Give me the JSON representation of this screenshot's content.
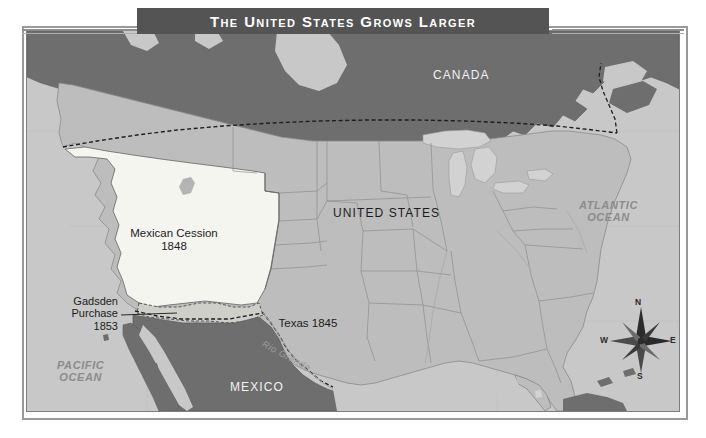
{
  "title": {
    "text": "The United States Grows Larger",
    "banner_color": "#545454",
    "text_color": "#ffffff"
  },
  "map": {
    "palette": {
      "ocean": "#c8c8c8",
      "united_states": "#bdbdbd",
      "foreign_territory": "#6e6e6e",
      "mexican_cession": "#f5f5f0",
      "lakes": "#d2d2d2",
      "border_line": "#555555",
      "state_line": "#8e8e8e"
    },
    "labels": {
      "canada": "CANADA",
      "united_states": "UNITED STATES",
      "mexico": "MEXICO",
      "atlantic_ocean": "ATLANTIC\nOCEAN",
      "pacific_ocean": "PACIFIC\nOCEAN",
      "mexican_cession": "Mexican Cession\n1848",
      "texas": "Texas 1845",
      "gadsden_purchase": "Gadsden\nPurchase\n1853",
      "rio_grande": "Rio Grande"
    },
    "territories": [
      {
        "name": "Mexican Cession",
        "year": "1848",
        "fill": "#f5f5f0"
      },
      {
        "name": "Texas",
        "year": "1845",
        "fill": "#bdbdbd"
      },
      {
        "name": "Gadsden Purchase",
        "year": "1853",
        "fill": "#bdbdbd"
      }
    ],
    "compass": {
      "north": "N",
      "east": "E",
      "south": "S",
      "west": "W"
    }
  }
}
